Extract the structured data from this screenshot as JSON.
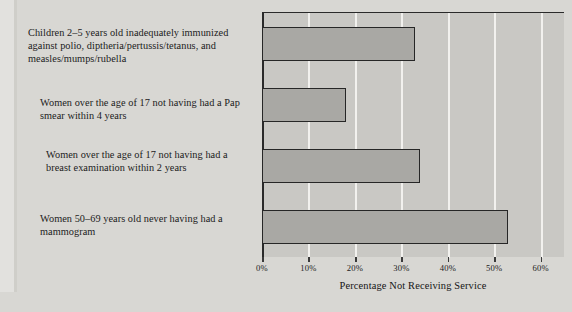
{
  "chart_data": {
    "type": "bar",
    "orientation": "horizontal",
    "title": "",
    "xlabel": "Percentage Not Receiving Service",
    "ylabel": "",
    "xlim": [
      0,
      65
    ],
    "xticks": [
      0,
      10,
      20,
      30,
      40,
      50,
      60
    ],
    "xtick_labels": [
      "0%",
      "10%",
      "20%",
      "30%",
      "40%",
      "50%",
      "60%"
    ],
    "grid": "vertical-white",
    "legend": "none",
    "categories": [
      "Children 2–5 years old inadequately immunized against polio, diptheria/pertussis/tetanus, and measles/mumps/rubella",
      "Women over the age of 17 not having had a Pap smear within 4 years",
      "Women over the age of 17 not having had a breast examination within 2 years",
      "Women 50–69 years old never having had a mammogram"
    ],
    "values": [
      33,
      18,
      34,
      53
    ],
    "bar_fill": "#a9a8a4",
    "bar_edge": "#262626",
    "plot_background": "#c9c8c4",
    "page_background": "#d8d7d3"
  },
  "axis": {
    "xlabel": "Percentage Not Receiving Service"
  },
  "labels": [
    {
      "line1": "Children 2–5 years old inadequately immunized",
      "line2": "against polio, diptheria/pertussis/tetanus, and",
      "line3": "measles/mumps/rubella",
      "full": "Children 2–5 years old inadequately immunized against polio, diptheria/pertussis/tetanus, and measles/mumps/rubella"
    },
    {
      "line1": "Women over the age of 17 not having had a Pap",
      "line2": "smear within 4 years",
      "line3": "",
      "full": "Women over the age of 17 not having had a Pap smear within 4 years"
    },
    {
      "line1": "Women over the age of 17 not having had a",
      "line2": "breast examination within 2 years",
      "line3": "",
      "full": "Women over the age of 17 not having had a breast examination within 2 years"
    },
    {
      "line1": "Women 50–69 years old never having had a",
      "line2": "mammogram",
      "line3": "",
      "full": "Women 50–69 years old never having had a mammogram"
    }
  ]
}
